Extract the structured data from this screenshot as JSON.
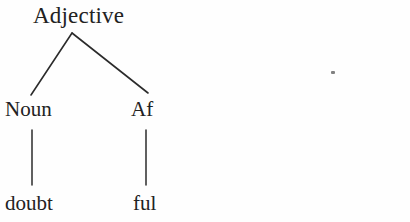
{
  "figure": {
    "name": "morphological-tree",
    "width": 410,
    "height": 222,
    "background_color": "#fefefe",
    "ink_color": "#222222",
    "edge_color": "#2b2b2b"
  },
  "tree": {
    "root": {
      "label": "Adjective",
      "x": 72,
      "y": 33
    },
    "children": [
      {
        "label": "Noun",
        "x": 32,
        "y": 95,
        "leaf": {
          "label": "doubt",
          "x": 32,
          "y": 185
        }
      },
      {
        "label": "Af",
        "x": 146,
        "y": 95,
        "leaf": {
          "label": "ful",
          "x": 146,
          "y": 185
        }
      }
    ]
  },
  "edges": [
    {
      "name": "root-to-noun",
      "x1": 72,
      "y1": 33,
      "x2": 31,
      "y2": 95
    },
    {
      "name": "root-to-af",
      "x1": 72,
      "y1": 33,
      "x2": 148,
      "y2": 93
    },
    {
      "name": "noun-to-doubt",
      "x1": 32,
      "y1": 130,
      "x2": 32,
      "y2": 185
    },
    {
      "name": "af-to-ful",
      "x1": 146,
      "y1": 130,
      "x2": 146,
      "y2": 185
    }
  ],
  "artifact": {
    "name": "scan-speck",
    "x": 333,
    "y": 73,
    "color": "#6b6b6b"
  }
}
